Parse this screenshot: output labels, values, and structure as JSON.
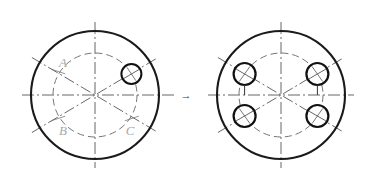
{
  "diagram": {
    "background_color": "#ffffff",
    "transition_arrow": "→",
    "colors": {
      "outline": "#1a1a1a",
      "centerline": "#555555",
      "construction": "#666666",
      "label": "#a8a8a8",
      "hole_outline": "#111111"
    },
    "labels": {
      "point_a": "A",
      "point_b": "B",
      "point_c": "C"
    },
    "figures": [
      {
        "name": "left-figure",
        "role": "initial-single-hole",
        "center": {
          "x": 95,
          "y": 95
        },
        "outer_radius": 64,
        "bolt_circle_radius": 42,
        "hole_radius": 10,
        "holes": [
          {
            "angle_deg": 30
          }
        ],
        "marked_points": [
          {
            "label": "A",
            "angle_deg": 150
          },
          {
            "label": "B",
            "angle_deg": 210
          },
          {
            "label": "C",
            "angle_deg": 330
          }
        ],
        "centerline_angles_deg": [
          0,
          30,
          150
        ]
      },
      {
        "name": "right-figure",
        "role": "resulting-four-hole-pattern",
        "center": {
          "x": 281,
          "y": 95
        },
        "outer_radius": 64,
        "bolt_circle_radius": 42,
        "hole_radius": 11,
        "holes": [
          {
            "angle_deg": 30
          },
          {
            "angle_deg": 150
          },
          {
            "angle_deg": 210
          },
          {
            "angle_deg": 330
          }
        ],
        "marked_points": [],
        "centerline_angles_deg": [
          0,
          30,
          150
        ]
      }
    ]
  }
}
